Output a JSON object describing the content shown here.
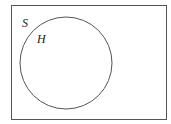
{
  "diagram": {
    "type": "venn",
    "universal_set": {
      "label": "S"
    },
    "sets": [
      {
        "label": "H"
      }
    ],
    "colors": {
      "stroke": "#444444",
      "background": "#ffffff"
    }
  }
}
